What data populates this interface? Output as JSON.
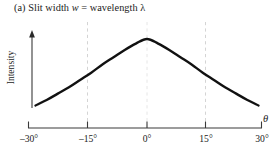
{
  "caption": {
    "prefix": "(a) Slit width ",
    "italic_symbol": "w",
    "relation": " = wavelength ",
    "wavelength_symbol": "λ",
    "full_text": "(a) Slit width w = wavelength λ"
  },
  "chart_data": {
    "type": "line",
    "title": "(a) Slit width w = wavelength λ",
    "xlabel": "θ",
    "ylabel": "Intensity",
    "xlim": [
      -30,
      30
    ],
    "ylim": [
      0,
      1
    ],
    "grid": true,
    "grid_axis": "x",
    "gridlines_at": [
      -15,
      0,
      15
    ],
    "legend": null,
    "xticks": [
      -30,
      -15,
      0,
      15,
      30
    ],
    "xticklabels": [
      "–30°",
      "–15°",
      "0°",
      "15°",
      "30°"
    ],
    "yticks": [],
    "yticklabels": [],
    "series": [
      {
        "name": "Intensity",
        "x": [
          -30,
          -27,
          -24,
          -21,
          -18,
          -15,
          -12,
          -9,
          -6,
          -3,
          0,
          3,
          6,
          9,
          12,
          15,
          18,
          21,
          24,
          27,
          30
        ],
        "values": [
          0.27,
          0.33,
          0.4,
          0.47,
          0.55,
          0.63,
          0.72,
          0.8,
          0.88,
          0.95,
          1.0,
          0.95,
          0.88,
          0.8,
          0.72,
          0.63,
          0.55,
          0.47,
          0.4,
          0.33,
          0.27
        ]
      }
    ],
    "annotations": []
  },
  "axes": {
    "x_symbol": "θ",
    "y_label": "Intensity",
    "tick_labels": {
      "neg30": "–30°",
      "neg15": "–15°",
      "zero": "0°",
      "pos15": "15°",
      "pos30": "30°"
    }
  },
  "colors": {
    "background": "#ffffff",
    "curve": "#111111",
    "axis": "#3a3a3a",
    "gridline": "#d4d4d4",
    "text": "#1b1b1b"
  }
}
